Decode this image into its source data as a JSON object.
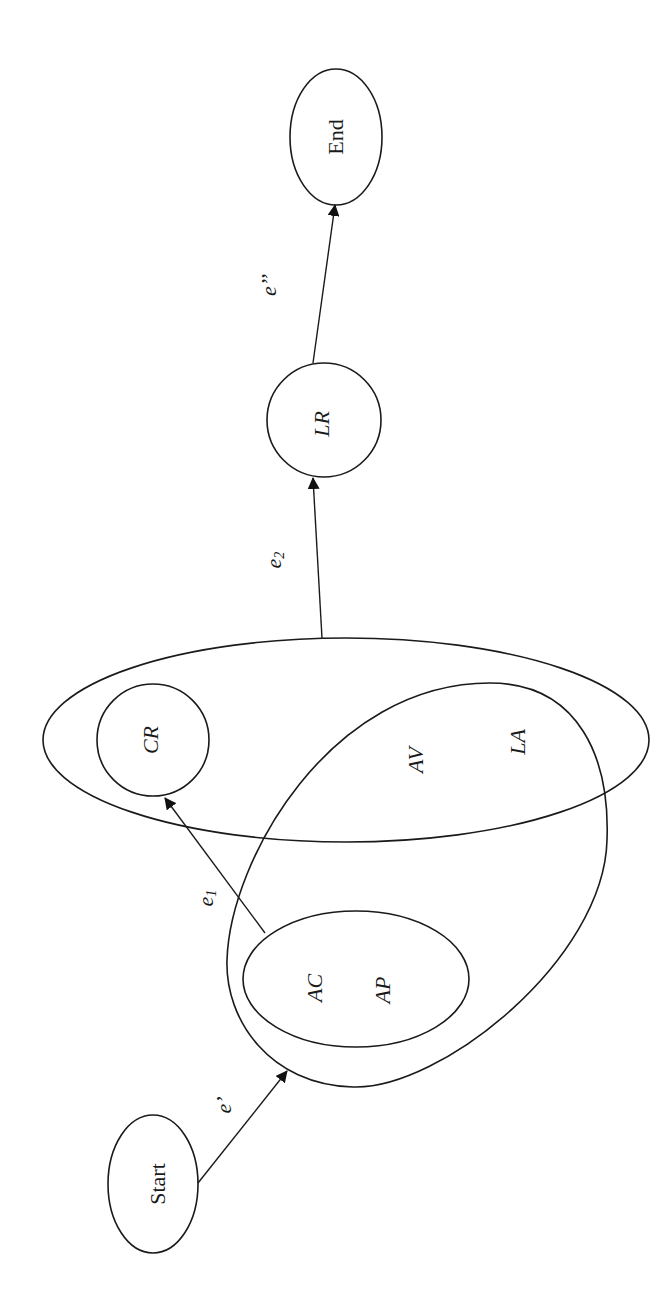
{
  "diagram": {
    "orientation": "rotated -90 degrees (text reads bottom-to-top)",
    "nodes": {
      "start": {
        "label": "Start"
      },
      "end": {
        "label": "End"
      },
      "cr": {
        "label": "CR"
      },
      "lr": {
        "label": "LR"
      },
      "ac": {
        "label": "AC"
      },
      "ap": {
        "label": "AP"
      },
      "av": {
        "label": "AV"
      },
      "la": {
        "label": "LA"
      }
    },
    "groups": [
      {
        "id": "ac-ap-set",
        "members": [
          "AC",
          "AP"
        ]
      },
      {
        "id": "outer-blob",
        "members": [
          "AC",
          "AP",
          "AV",
          "LA"
        ]
      },
      {
        "id": "big-ellipse",
        "members": [
          "CR",
          "AV",
          "LA"
        ]
      }
    ],
    "edges": {
      "e_prime": {
        "base": "e",
        "mark": "’",
        "from": "Start",
        "to": "outer-blob"
      },
      "e1": {
        "base": "e",
        "sub": "1",
        "from": "ac-ap-set",
        "to": "CR"
      },
      "e2": {
        "base": "e",
        "sub": "2",
        "from": "big-ellipse",
        "to": "LR"
      },
      "e_double_prime": {
        "base": "e",
        "mark": "’’",
        "from": "LR",
        "to": "End"
      }
    }
  }
}
